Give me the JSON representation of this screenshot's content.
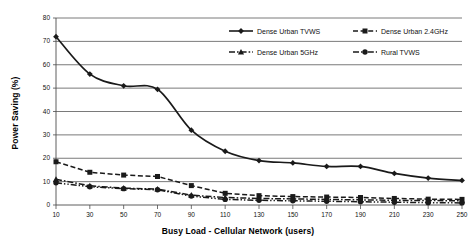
{
  "chart_data": {
    "type": "line",
    "title": "",
    "subtitle": "",
    "xlabel": "Busy Load - Cellular Network (users)",
    "ylabel": "Power Saving (%)",
    "x": [
      10,
      30,
      50,
      70,
      90,
      110,
      130,
      150,
      170,
      190,
      210,
      230,
      250
    ],
    "xlim": [
      10,
      250
    ],
    "ylim": [
      0,
      80
    ],
    "x_ticks": [
      "10",
      "30",
      "50",
      "70",
      "90",
      "110",
      "130",
      "150",
      "170",
      "190",
      "210",
      "230",
      "250"
    ],
    "y_ticks": [
      "0",
      "10",
      "20",
      "30",
      "40",
      "50",
      "60",
      "70",
      "80"
    ],
    "grid": "horizontal",
    "legend_position": "top-right-inside",
    "series": [
      {
        "name": "Dense Urban TVWS",
        "marker": "diamond",
        "line_style": "solid",
        "color": "#1a1a1a",
        "values": [
          72,
          56,
          51,
          49.5,
          32,
          23,
          19,
          18,
          16.5,
          16.5,
          13.5,
          11.5,
          10.5
        ]
      },
      {
        "name": "Dense Urban 2.4GHz",
        "marker": "square",
        "line_style": "dashed",
        "color": "#1a1a1a",
        "values": [
          18.5,
          14,
          12.8,
          12.2,
          8.3,
          5,
          4,
          3.6,
          3.4,
          3.2,
          2.8,
          2.5,
          2.4
        ]
      },
      {
        "name": "Dense Urban 5GHz",
        "marker": "triangle",
        "line_style": "dash-dot",
        "color": "#1a1a1a",
        "values": [
          11,
          8.2,
          7.2,
          6.8,
          4.2,
          3.2,
          2.8,
          2.6,
          2.4,
          2.2,
          2,
          1.9,
          1.8
        ]
      },
      {
        "name": "Rural TVWS",
        "marker": "circle",
        "line_style": "dash-dot-dot",
        "color": "#1a1a1a",
        "values": [
          9.5,
          7.8,
          7,
          6.5,
          3.8,
          2.4,
          2,
          1.8,
          1.6,
          1.4,
          1.2,
          1,
          0.9
        ]
      }
    ]
  }
}
